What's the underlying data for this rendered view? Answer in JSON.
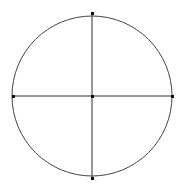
{
  "diagram": {
    "type": "circle-with-crosshair",
    "stroke_color": "#333333",
    "background": "#ffffff",
    "circle": {
      "cx": 92,
      "cy": 96,
      "r": 80
    },
    "points": [
      {
        "name": "top",
        "x": 92,
        "y": 14
      },
      {
        "name": "bottom",
        "x": 92,
        "y": 178
      },
      {
        "name": "left",
        "x": 13,
        "y": 96
      },
      {
        "name": "right",
        "x": 172,
        "y": 96
      },
      {
        "name": "center",
        "x": 92,
        "y": 96
      }
    ]
  }
}
